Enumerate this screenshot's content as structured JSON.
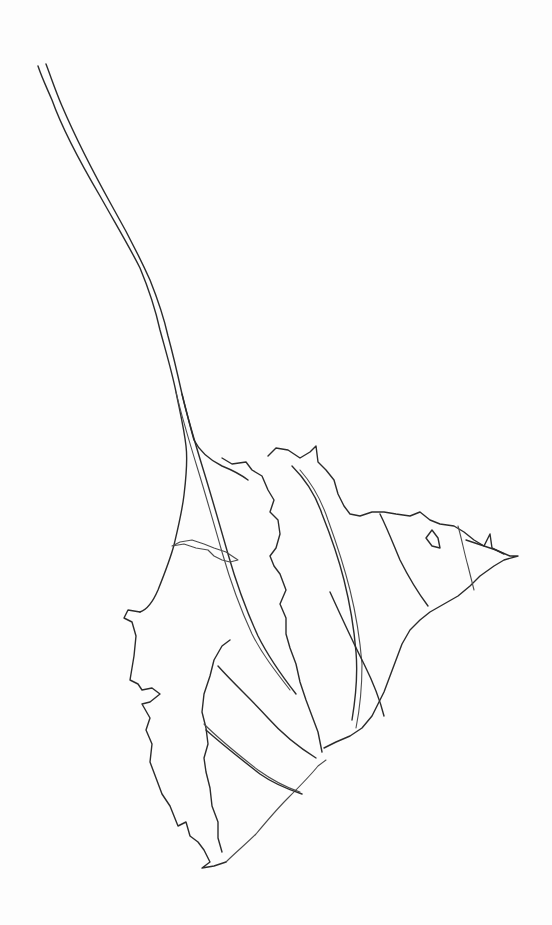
{
  "drawing": {
    "description": "Hand-drawn line sketch of a branching stem leading into a jagged leaf / delta-like outline",
    "background_color": "#fdfdfd",
    "stroke_color": "#2b2b2b",
    "paths": [
      {
        "name": "stem-left-line",
        "d": "M38,66 C42,78 46,86 52,100 C62,128 80,162 100,196 C118,228 130,248 140,268 C150,292 156,312 160,330 C166,352 172,372 176,392 C180,412 184,428 186,446 C188,462 186,478 184,495 C182,512 178,528 174,545 C170,560 164,575 158,590 C152,604 146,610 140,612"
      },
      {
        "name": "stem-right-line",
        "d": "M46,64 C52,80 56,92 62,106 C74,134 92,170 112,206 C128,234 140,258 150,280 C158,300 164,318 168,336 C174,358 178,376 182,394 C186,410 190,426 194,440 C200,452 210,460 222,466 C232,470 240,474 248,480"
      },
      {
        "name": "stem-inner-line-a",
        "d": "M176,392 C182,418 190,444 198,470 C206,496 214,524 222,552 C230,580 240,608 252,634 C262,654 276,672 290,690"
      },
      {
        "name": "stem-inner-line-b",
        "d": "M182,394 C188,420 196,446 204,472 C212,498 220,526 228,554 C236,582 246,610 258,636 C268,656 282,676 296,694"
      },
      {
        "name": "leaf-left-outline",
        "d": "M140,612 L128,610 L124,618 L132,622 L136,636 L134,656 L130,680 L138,684 L142,690 L152,688 L160,694 L150,702 L142,704 L150,718 L146,730 L152,744 L150,762 L156,778 L162,794 L170,806 L174,816 L178,826 L186,822 L190,836 L198,842 L204,850 L210,862 L202,868 L214,866 L226,862"
      },
      {
        "name": "leaf-bottom-right-edge",
        "d": "M226,862 C236,852 246,844 256,834 C266,822 276,810 288,798 C300,786 310,776 318,766 L326,760"
      },
      {
        "name": "inner-lobe-outline",
        "d": "M230,640 L222,646 L214,660 L210,676 L204,694 L202,712 L206,728 L208,744 L204,758 L206,772 L210,788 L212,806 L218,822 L218,838 L222,852"
      },
      {
        "name": "band-1",
        "d": "M218,666 C234,684 252,700 268,718 C284,736 300,748 316,758"
      },
      {
        "name": "band-2",
        "d": "M204,724 C222,742 240,756 258,770 C272,780 288,788 300,792"
      },
      {
        "name": "band-2b",
        "d": "M206,730 C224,746 242,760 260,774 C274,784 290,790 302,794"
      },
      {
        "name": "upper-branch-outline",
        "d": "M222,458 L232,464 L246,462 L252,470 L262,476 L268,490 L274,500 L270,512 L278,520 L280,534 L276,548 L270,556 L274,566 L280,574 L286,590 L280,604 L286,618 L286,634 L290,648 L296,664 L300,682 L306,700 L312,716 L318,732 L322,752"
      },
      {
        "name": "side-spike-left",
        "d": "M172,546 L184,544 L196,548 L208,550 L214,556 L222,560 L230,562 L238,560 L226,552 L214,548 L204,544 L192,540 L180,542 Z"
      },
      {
        "name": "right-upper-lobe",
        "d": "M268,456 L276,448 L288,450 L300,458 L310,452 L316,446 L318,462 L326,470 L334,480 L338,494 L344,506 L350,514 L360,516 L372,512 L384,512 L396,514 L410,516 L420,512 L430,520 L440,524 L454,526 L464,532 L474,540 L484,546 L496,550 L510,556 L518,556 L504,560 L494,566 L480,576 L470,586 L458,596 L444,604 L430,612 L420,620 L410,630 L402,644 L396,660 L390,676 L384,692 L378,704 L372,716 L362,728 L350,736 L336,742 L324,748"
      },
      {
        "name": "right-inner-vein-a",
        "d": "M292,466 C306,480 316,496 322,514 C330,534 338,556 344,580 C350,604 354,628 356,652 C358,676 356,696 352,720"
      },
      {
        "name": "right-inner-vein-b",
        "d": "M300,470 C314,486 322,502 328,520 C336,542 344,566 350,590 C356,614 360,640 362,664 C362,688 360,708 356,728"
      },
      {
        "name": "right-inner-vein-c",
        "d": "M330,592 C340,614 352,640 364,664 C374,684 380,700 384,716"
      },
      {
        "name": "right-band-1",
        "d": "M380,514 C388,530 394,546 400,560 C408,576 416,590 428,606"
      },
      {
        "name": "right-band-2",
        "d": "M458,526 C462,540 464,552 468,566 C470,574 472,582 474,590"
      },
      {
        "name": "right-notch",
        "d": "M432,530 L438,538 L440,548 L432,546 L426,538 Z"
      },
      {
        "name": "tip-spike",
        "d": "M466,540 L484,546 L490,534 L492,548 L504,554"
      }
    ]
  }
}
